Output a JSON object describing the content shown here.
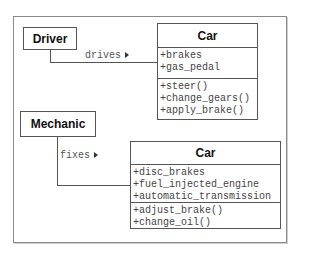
{
  "diagram": {
    "type": "uml-class-diagram",
    "top": {
      "actor": {
        "name": "Driver"
      },
      "association": {
        "label": "drives",
        "direction_icon": "triangle-right"
      },
      "class": {
        "name": "Car",
        "attributes": [
          "+brakes",
          "+gas_pedal"
        ],
        "operations": [
          "+steer()",
          "+change_gears()",
          "+apply_brake()"
        ]
      }
    },
    "bottom": {
      "actor": {
        "name": "Mechanic"
      },
      "association": {
        "label": "fixes",
        "direction_icon": "triangle-right"
      },
      "class": {
        "name": "Car",
        "attributes": [
          "+disc_brakes",
          "+fuel_injected_engine",
          "+automatic_transmission"
        ],
        "operations": [
          "+adjust_brake()",
          "+change_oil()"
        ]
      }
    }
  }
}
